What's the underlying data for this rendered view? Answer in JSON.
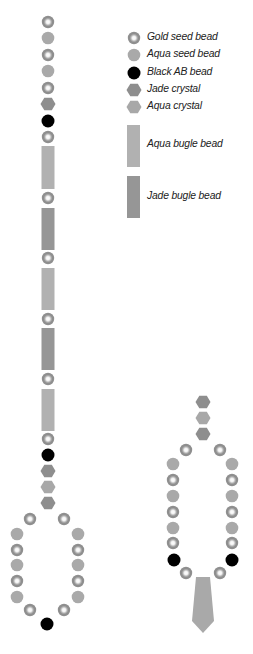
{
  "legend": {
    "items": [
      {
        "type": "gold-seed",
        "label": "Gold seed bead",
        "x": 134,
        "y": 38
      },
      {
        "type": "aqua-seed",
        "label": "Aqua seed bead",
        "x": 134,
        "y": 55
      },
      {
        "type": "black-ab",
        "label": "Black AB bead",
        "x": 134,
        "y": 73
      },
      {
        "type": "jade-crystal",
        "label": "Jade crystal",
        "x": 134,
        "y": 90
      },
      {
        "type": "aqua-crystal",
        "label": "Aqua crystal",
        "x": 134,
        "y": 107
      }
    ],
    "bugles": [
      {
        "type": "aqua-bugle",
        "label": "Aqua bugle bead",
        "x": 127,
        "y": 125,
        "h": 42
      },
      {
        "type": "jade-bugle",
        "label": "Jade bugle bead",
        "x": 127,
        "y": 176,
        "h": 42
      }
    ]
  },
  "colors": {
    "gold_outer": "#8f8f8f",
    "gold_inner": "#ffffff",
    "aqua_seed": "#a9a9a9",
    "black_ab": "#000000",
    "jade": "#8e8e8e",
    "aqua": "#a8a8a8",
    "aqua_bugle": "#b1b1b1",
    "jade_bugle": "#969696",
    "drop": "#a9a9a9"
  },
  "strand": {
    "beads": [
      {
        "t": "gold",
        "x": 48,
        "y": 22
      },
      {
        "t": "aqua",
        "x": 48,
        "y": 38
      },
      {
        "t": "gold",
        "x": 48,
        "y": 55
      },
      {
        "t": "aqua",
        "x": 48,
        "y": 71
      },
      {
        "t": "gold",
        "x": 48,
        "y": 88
      },
      {
        "t": "jadehex",
        "x": 48,
        "y": 104
      },
      {
        "t": "black",
        "x": 48,
        "y": 121
      },
      {
        "t": "gold",
        "x": 48,
        "y": 137
      },
      {
        "t": "aquabugle",
        "x": 48,
        "y": 146,
        "h": 43
      },
      {
        "t": "gold",
        "x": 48,
        "y": 198
      },
      {
        "t": "jadebugle",
        "x": 48,
        "y": 208,
        "h": 42
      },
      {
        "t": "gold",
        "x": 48,
        "y": 258
      },
      {
        "t": "aquabugle",
        "x": 48,
        "y": 268,
        "h": 42
      },
      {
        "t": "gold",
        "x": 48,
        "y": 319
      },
      {
        "t": "jadebugle",
        "x": 48,
        "y": 328,
        "h": 42
      },
      {
        "t": "gold",
        "x": 48,
        "y": 379
      },
      {
        "t": "aquabugle",
        "x": 48,
        "y": 389,
        "h": 42
      },
      {
        "t": "gold",
        "x": 48,
        "y": 439
      },
      {
        "t": "black",
        "x": 48,
        "y": 455
      },
      {
        "t": "jadehex",
        "x": 48,
        "y": 471
      },
      {
        "t": "aquahex",
        "x": 48,
        "y": 487
      },
      {
        "t": "jadehex",
        "x": 48,
        "y": 503
      },
      {
        "t": "gold",
        "x": 30,
        "y": 519
      },
      {
        "t": "gold",
        "x": 64,
        "y": 519
      },
      {
        "t": "aqua",
        "x": 17,
        "y": 534
      },
      {
        "t": "aqua",
        "x": 78,
        "y": 534
      },
      {
        "t": "gold",
        "x": 17,
        "y": 550
      },
      {
        "t": "gold",
        "x": 78,
        "y": 550
      },
      {
        "t": "aqua",
        "x": 17,
        "y": 565
      },
      {
        "t": "aqua",
        "x": 78,
        "y": 565
      },
      {
        "t": "gold",
        "x": 17,
        "y": 581
      },
      {
        "t": "gold",
        "x": 78,
        "y": 581
      },
      {
        "t": "aqua",
        "x": 17,
        "y": 597
      },
      {
        "t": "aqua",
        "x": 78,
        "y": 597
      },
      {
        "t": "gold",
        "x": 30,
        "y": 610
      },
      {
        "t": "gold",
        "x": 64,
        "y": 610
      },
      {
        "t": "black",
        "x": 47,
        "y": 624
      }
    ]
  },
  "pendant": {
    "beads": [
      {
        "t": "jadehex",
        "x": 203,
        "y": 402
      },
      {
        "t": "aquahex",
        "x": 203,
        "y": 418
      },
      {
        "t": "jadehex",
        "x": 203,
        "y": 434
      },
      {
        "t": "gold",
        "x": 186,
        "y": 450
      },
      {
        "t": "gold",
        "x": 220,
        "y": 450
      },
      {
        "t": "aqua",
        "x": 173,
        "y": 464
      },
      {
        "t": "aqua",
        "x": 232,
        "y": 464
      },
      {
        "t": "gold",
        "x": 173,
        "y": 480
      },
      {
        "t": "gold",
        "x": 232,
        "y": 480
      },
      {
        "t": "aqua",
        "x": 173,
        "y": 496
      },
      {
        "t": "aqua",
        "x": 232,
        "y": 496
      },
      {
        "t": "gold",
        "x": 173,
        "y": 512
      },
      {
        "t": "gold",
        "x": 232,
        "y": 512
      },
      {
        "t": "aqua",
        "x": 173,
        "y": 528
      },
      {
        "t": "aqua",
        "x": 232,
        "y": 528
      },
      {
        "t": "gold",
        "x": 173,
        "y": 543
      },
      {
        "t": "gold",
        "x": 232,
        "y": 543
      },
      {
        "t": "black",
        "x": 174,
        "y": 560
      },
      {
        "t": "black",
        "x": 232,
        "y": 560
      },
      {
        "t": "gold",
        "x": 186,
        "y": 573
      },
      {
        "t": "gold",
        "x": 220,
        "y": 573
      }
    ],
    "drop": {
      "points": "196,577 210,577 214,621 203,633 192,621"
    }
  }
}
